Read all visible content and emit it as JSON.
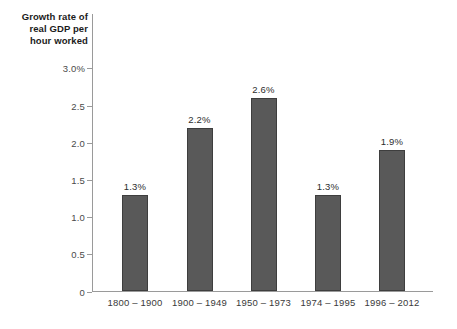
{
  "chart_data": {
    "type": "bar",
    "title": "",
    "subtitle": "",
    "xlabel": "",
    "ylabel": "Growth rate of\nreal GDP per\nhour worked",
    "categories": [
      "1800 – 1900",
      "1900 – 1949",
      "1950 – 1973",
      "1974 – 1995",
      "1996 – 2012"
    ],
    "values": [
      1.3,
      2.2,
      2.6,
      1.3,
      1.9
    ],
    "value_labels": [
      "1.3%",
      "2.2%",
      "2.6%",
      "1.3%",
      "1.9%"
    ],
    "ylim": [
      0,
      3.0
    ],
    "y_ticks": [
      0,
      0.5,
      1.0,
      1.5,
      2.0,
      2.5,
      3.0
    ],
    "y_tick_labels": [
      "0",
      "0.5",
      "1.0",
      "1.5",
      "2.0",
      "2.5",
      "3.0%"
    ],
    "grid": false,
    "legend": null,
    "legend_position": "none",
    "colors": {
      "bar_fill": "#595959",
      "bar_stroke": "#3e3e3e",
      "axis": "#9a9a9a",
      "tick_text": "#4a4a4a",
      "value_text": "#2d2d2d",
      "title_text": "#1b1b1b",
      "background": "#ffffff"
    }
  }
}
